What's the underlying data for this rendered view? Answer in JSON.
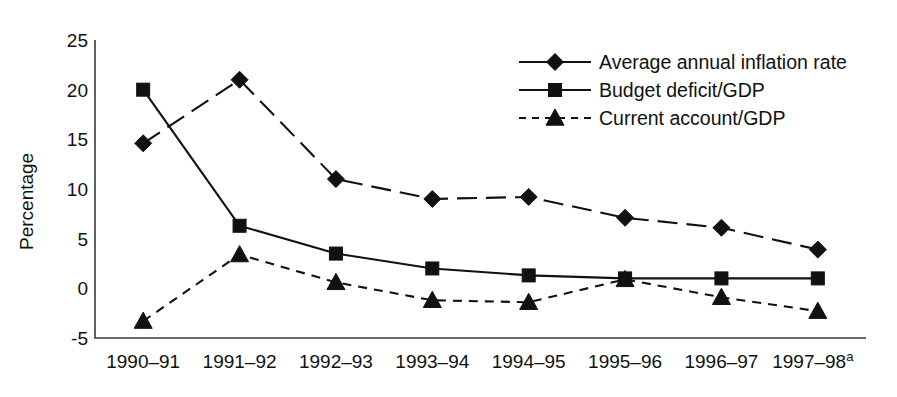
{
  "chart_data": {
    "type": "line",
    "title": "",
    "xlabel": "",
    "ylabel": "Percentage",
    "categories": [
      "1990–91",
      "1991–92",
      "1992–93",
      "1993–94",
      "1994–95",
      "1995–96",
      "1996–97",
      "1997–98"
    ],
    "last_category_footnote": "a",
    "ylim": [
      -5,
      25
    ],
    "yticks": [
      -5,
      0,
      5,
      10,
      15,
      20,
      25
    ],
    "ytick_labels": [
      "-5",
      "0",
      "5",
      "10",
      "15",
      "20",
      "25"
    ],
    "grid": false,
    "legend_position": "top-right",
    "series": [
      {
        "name": "Average annual inflation rate",
        "marker": "diamond",
        "line_style": "long-dash",
        "values": [
          14.6,
          21.0,
          11.0,
          9.0,
          9.2,
          7.1,
          6.1,
          3.9
        ]
      },
      {
        "name": "Budget deficit/GDP",
        "marker": "square",
        "line_style": "solid",
        "values": [
          20.0,
          6.3,
          3.5,
          2.0,
          1.3,
          1.0,
          1.0,
          1.0
        ]
      },
      {
        "name": "Current account/GDP",
        "marker": "triangle",
        "line_style": "dashed",
        "values": [
          -3.3,
          3.4,
          0.6,
          -1.2,
          -1.4,
          0.9,
          -0.9,
          -2.3
        ]
      }
    ]
  },
  "axes": {
    "y_axis_title": "Percentage"
  },
  "legend": {
    "entries": [
      {
        "label": "Average annual inflation rate"
      },
      {
        "label": "Budget deficit/GDP"
      },
      {
        "label": "Current account/GDP"
      }
    ]
  },
  "colors": {
    "ink": "#111111",
    "axis": "#3a3a3a",
    "background": "#ffffff"
  }
}
